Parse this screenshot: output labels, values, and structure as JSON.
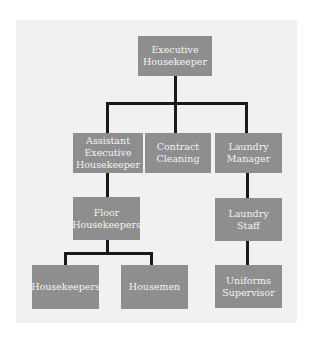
{
  "chart": {
    "type": "org-chart",
    "nodes": [
      {
        "id": "exec",
        "label": "Executive\nHousekeeper"
      },
      {
        "id": "asst",
        "label": "Assistant\nExecutive\nHousekeeper"
      },
      {
        "id": "contract",
        "label": "Contract\nCleaning"
      },
      {
        "id": "laundry_mgr",
        "label": "Laundry\nManager"
      },
      {
        "id": "floor",
        "label": "Floor\nHousekeepers"
      },
      {
        "id": "laundry_staff",
        "label": "Laundry\nStaff"
      },
      {
        "id": "housekeepers",
        "label": "Housekeepers"
      },
      {
        "id": "housemen",
        "label": "Housemen"
      },
      {
        "id": "uniforms",
        "label": "Uniforms\nSupervisor"
      }
    ],
    "edges": [
      [
        "exec",
        "asst"
      ],
      [
        "exec",
        "contract"
      ],
      [
        "exec",
        "laundry_mgr"
      ],
      [
        "asst",
        "floor"
      ],
      [
        "laundry_mgr",
        "laundry_staff"
      ],
      [
        "floor",
        "housekeepers"
      ],
      [
        "floor",
        "housemen"
      ],
      [
        "laundry_staff",
        "uniforms"
      ]
    ],
    "colors": {
      "box": "#8e8e8e",
      "text": "#f3f3f3",
      "line": "#1a1a1a",
      "background": "#f1f1f1"
    }
  }
}
